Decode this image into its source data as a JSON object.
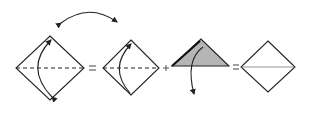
{
  "diagram": {
    "type": "origami-fold-sequence",
    "steps": [
      {
        "id": "square-valley-fold",
        "shape": "diamond",
        "fold_line": "dashed-horizontal",
        "arrow": "fold-bottom-to-top"
      },
      {
        "id": "square-valley-fold-alt",
        "shape": "diamond",
        "fold_line": "dashed-horizontal",
        "arrow": "fold-bottom-to-top"
      },
      {
        "id": "folded-triangle",
        "shape": "triangle",
        "fill": "#b5b5b5",
        "arrow": "unfold-down"
      },
      {
        "id": "unfolded-square",
        "shape": "diamond",
        "crease": "solid-horizontal"
      }
    ],
    "operators": [
      "=",
      "+",
      "="
    ],
    "top_arrow": "double-headed-swap",
    "colors": {
      "stroke": "#222222",
      "fill": "#b5b5b5",
      "background": "#ffffff"
    }
  }
}
